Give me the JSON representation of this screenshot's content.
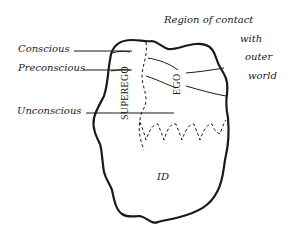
{
  "diagram": {
    "levels": [
      {
        "label": "Conscious"
      },
      {
        "label": "Preconscious"
      },
      {
        "label": "Unconscious"
      }
    ],
    "structures": {
      "superego": "SUPEREGO",
      "ego": "EGO",
      "id": "ID"
    },
    "external": {
      "line1": "Region of contact",
      "line2": "with",
      "line3": "outer",
      "line4": "world"
    },
    "colors": {
      "ink": "#1a1a1a",
      "background": "#ffffff"
    }
  }
}
